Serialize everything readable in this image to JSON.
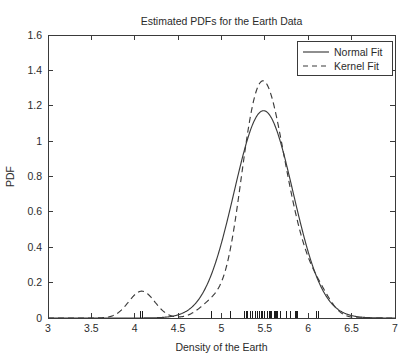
{
  "chart_data": {
    "type": "line",
    "title": "Estimated PDFs for the Earth Data",
    "xlabel": "Density of the Earth",
    "ylabel": "PDF",
    "xlim": [
      3,
      7
    ],
    "ylim": [
      0,
      1.6
    ],
    "xticks": [
      3,
      3.5,
      4,
      4.5,
      5,
      5.5,
      6,
      6.5,
      7
    ],
    "xtick_labels": [
      "3",
      "3.5",
      "4",
      "4.5",
      "5",
      "5.5",
      "6",
      "6.5",
      "7"
    ],
    "yticks": [
      0,
      0.2,
      0.4,
      0.6,
      0.8,
      1,
      1.2,
      1.4,
      1.6
    ],
    "ytick_labels": [
      "0",
      "0.2",
      "0.4",
      "0.6",
      "0.8",
      "1",
      "1.2",
      "1.4",
      "1.6"
    ],
    "grid": false,
    "legend_position": "upper right",
    "series": [
      {
        "name": "Normal Fit",
        "style": "solid",
        "color": "#3b3b3b",
        "distribution": "normal",
        "mean": 5.4848,
        "std": 0.3404,
        "peak_value": 1.1715,
        "peak_x": 5.4848
      },
      {
        "name": "Kernel Fit",
        "style": "dashed",
        "color": "#3b3b3b",
        "distribution": "kernel-density",
        "bandwidth": 0.15,
        "peak_value": 1.552,
        "peak_x": 5.56,
        "secondary_peak_value": 0.097,
        "secondary_peak_x": 4.07
      }
    ],
    "rug_label": "Data observations (rug marks on x-axis)",
    "rug_values": [
      4.07,
      4.09,
      4.88,
      5.1,
      5.26,
      5.27,
      5.29,
      5.29,
      5.3,
      5.34,
      5.34,
      5.36,
      5.39,
      5.42,
      5.44,
      5.46,
      5.47,
      5.5,
      5.5,
      5.53,
      5.55,
      5.57,
      5.58,
      5.61,
      5.62,
      5.63,
      5.65,
      5.68,
      5.75,
      5.79,
      5.85,
      5.86,
      5.88,
      6.09,
      6.12
    ]
  },
  "legend": {
    "entries": [
      {
        "label": "Normal Fit",
        "style": "solid"
      },
      {
        "label": "Kernel Fit",
        "style": "dashed"
      }
    ]
  }
}
